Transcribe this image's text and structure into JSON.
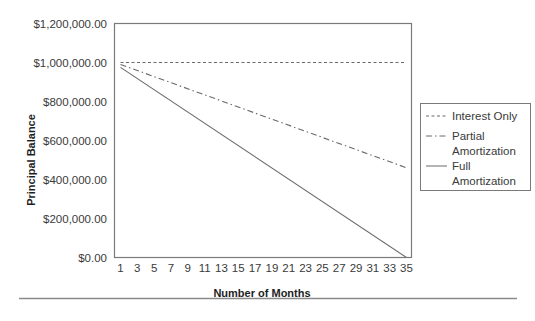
{
  "chart_data": {
    "type": "line",
    "title": "",
    "xlabel": "Number of Months",
    "ylabel": "Principal Balance",
    "x": [
      1,
      2,
      3,
      4,
      5,
      6,
      7,
      8,
      9,
      10,
      11,
      12,
      13,
      14,
      15,
      16,
      17,
      18,
      19,
      20,
      21,
      22,
      23,
      24,
      25,
      26,
      27,
      28,
      29,
      30,
      31,
      32,
      33,
      34,
      35
    ],
    "x_tick_labels": [
      "1",
      "3",
      "5",
      "7",
      "9",
      "11",
      "13",
      "15",
      "17",
      "19",
      "21",
      "23",
      "25",
      "27",
      "29",
      "31",
      "33",
      "35"
    ],
    "y_tick_labels": [
      "$0.00",
      "$200,000.00",
      "$400,000.00",
      "$600,000.00",
      "$800,000.00",
      "$1,000,000.00",
      "$1,200,000.00"
    ],
    "y_ticks": [
      0,
      200000,
      400000,
      600000,
      800000,
      1000000,
      1200000
    ],
    "ylim": [
      0,
      1200000
    ],
    "xlim": [
      1,
      35
    ],
    "grid": false,
    "legend_position": "right",
    "series": [
      {
        "name": "Interest Only",
        "style": "dashed",
        "start": 1000000,
        "end": 1000000
      },
      {
        "name": "Partial Amortization",
        "style": "dash-dot",
        "start": 990000,
        "end": 460000
      },
      {
        "name": "Full Amortization",
        "style": "solid",
        "start": 975000,
        "end": 0
      }
    ]
  },
  "legend": {
    "items": [
      {
        "lines": [
          "Interest Only"
        ]
      },
      {
        "lines": [
          "Partial",
          "Amortization"
        ]
      },
      {
        "lines": [
          "Full",
          "Amortization"
        ]
      }
    ]
  },
  "colors": {
    "line": "#6a6a6a",
    "axis": "#7a7a7a",
    "text": "#3a3a3a"
  }
}
